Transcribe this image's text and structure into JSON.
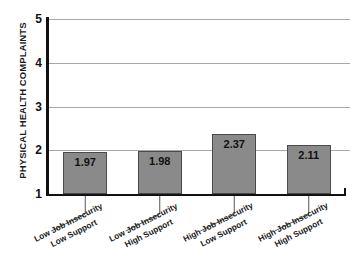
{
  "chart_data": {
    "type": "bar",
    "title": "",
    "xlabel": "",
    "ylabel": "PHYSICAL HEALTH COMPLAINTS",
    "ylim": [
      1,
      5
    ],
    "yticks": [
      "1",
      "2",
      "3",
      "4",
      "5"
    ],
    "gridlines": [
      2,
      3,
      4,
      5
    ],
    "grid": true,
    "legend": "none",
    "baseline": 1,
    "categories": [
      "Low Job Insecurity Low Support",
      "Low Job Insecurity High Support",
      "High Job Insecurity Low Support",
      "High Job Insecurity High Support"
    ],
    "category_lines": [
      [
        "Low Job Insecurity",
        "Low Support"
      ],
      [
        "Low Job Insecurity",
        "High Support"
      ],
      [
        "High Job Insecurity",
        "Low Support"
      ],
      [
        "High Job Insecurity",
        "High Support"
      ]
    ],
    "values": [
      1.97,
      1.98,
      2.37,
      2.11
    ],
    "value_labels": [
      "1.97",
      "1.98",
      "2.37",
      "2.11"
    ],
    "colors": {
      "bar_fill": "#8a8a8a",
      "bar_border": "#4a4a4a",
      "axis": "#111111",
      "gridline": "#a8a8a8",
      "text": "#1a1a1a",
      "background": "#ffffff"
    }
  }
}
